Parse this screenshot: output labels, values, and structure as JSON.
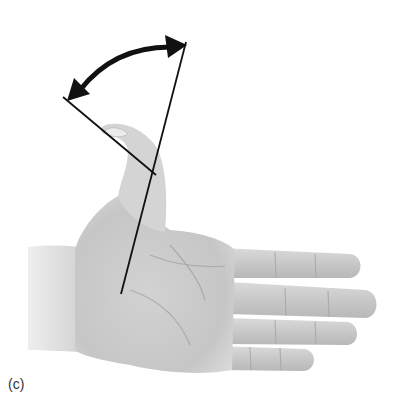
{
  "figure": {
    "panel_label": "(c)",
    "colors": {
      "skin_light": "#e4e4e4",
      "skin_mid": "#cfcfcf",
      "skin_dark": "#b3b3b3",
      "line": "#111111",
      "background": "#ffffff"
    }
  }
}
